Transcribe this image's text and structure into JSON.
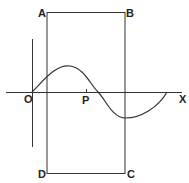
{
  "diagram": {
    "labels": {
      "A": "A",
      "B": "B",
      "C": "C",
      "D": "D",
      "O": "O",
      "P": "P",
      "X": "X"
    },
    "line_color": "#333333",
    "curve": "sine wave starting at O, one full period along OX"
  }
}
